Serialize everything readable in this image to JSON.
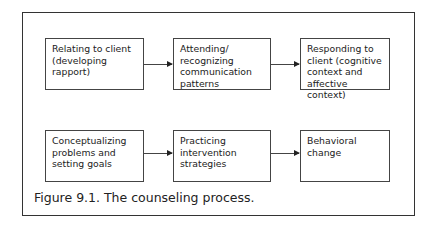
{
  "diagram": {
    "nodes": [
      {
        "id": "n1",
        "label": "Relating to client (developing rapport)"
      },
      {
        "id": "n2",
        "label": "Attending/ recognizing communication patterns"
      },
      {
        "id": "n3",
        "label": "Responding to client (cognitive context and affective context)"
      },
      {
        "id": "n4",
        "label": "Conceptualizing problems and setting goals"
      },
      {
        "id": "n5",
        "label": "Practicing intervention strategies"
      },
      {
        "id": "n6",
        "label": "Behavioral change"
      }
    ],
    "edges": [
      {
        "from": "n1",
        "to": "n2"
      },
      {
        "from": "n2",
        "to": "n3"
      },
      {
        "from": "n4",
        "to": "n5"
      },
      {
        "from": "n5",
        "to": "n6"
      }
    ]
  },
  "caption": "Figure 9.1. The counseling process."
}
